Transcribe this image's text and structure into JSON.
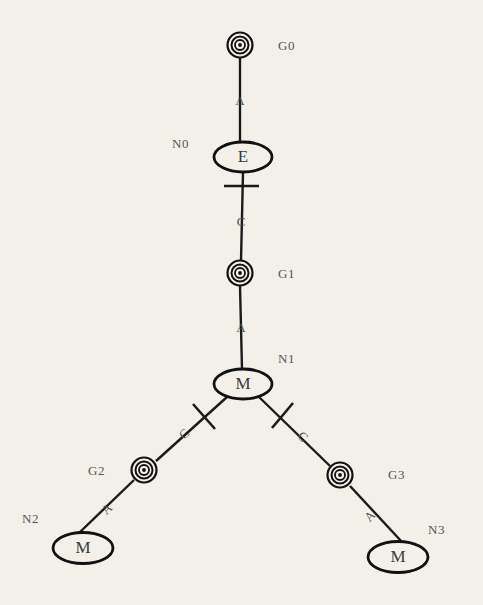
{
  "diagram": {
    "background_color": "#f3f0ea",
    "stroke_color": "#111111",
    "label_color": "#55544f",
    "nodes": [
      {
        "id": "G0",
        "kind": "bullseye",
        "label": "G0",
        "cx": 240,
        "cy": 45,
        "label_x": 278,
        "label_y": 49
      },
      {
        "id": "N0",
        "kind": "ellipse",
        "text": "E",
        "label": "N0",
        "cx": 243,
        "cy": 157,
        "rx": 29,
        "ry": 15,
        "label_x": 172,
        "label_y": 147
      },
      {
        "id": "G1",
        "kind": "bullseye",
        "label": "G1",
        "cx": 240,
        "cy": 273,
        "label_x": 278,
        "label_y": 277
      },
      {
        "id": "N1",
        "kind": "ellipse",
        "text": "M",
        "label": "N1",
        "cx": 243,
        "cy": 384,
        "rx": 29,
        "ry": 15,
        "label_x": 278,
        "label_y": 360
      },
      {
        "id": "G2",
        "kind": "bullseye",
        "label": "G2",
        "cx": 144,
        "cy": 470,
        "label_x": 88,
        "label_y": 472
      },
      {
        "id": "G3",
        "kind": "bullseye",
        "label": "G3",
        "cx": 340,
        "cy": 475,
        "label_x": 388,
        "label_y": 474
      },
      {
        "id": "N2",
        "kind": "ellipse",
        "text": "M",
        "label": "N2",
        "cx": 83,
        "cy": 548,
        "rx": 29,
        "ry": 15,
        "label_x": 22,
        "label_y": 518
      },
      {
        "id": "N3",
        "kind": "ellipse",
        "text": "M",
        "label": "N3",
        "cx": 398,
        "cy": 557,
        "rx": 29,
        "ry": 15,
        "label_x": 428,
        "label_y": 530
      }
    ],
    "edges": [
      {
        "from": "G0",
        "to": "N0",
        "label": "A",
        "x1": 240,
        "y1": 58,
        "x2": 240,
        "y2": 142,
        "label_x": 240,
        "label_y": 101,
        "crossbar": false
      },
      {
        "from": "N0",
        "to": "G1",
        "label": "C",
        "x1": 243,
        "y1": 172,
        "x2": 241,
        "y2": 261,
        "label_x": 241,
        "label_y": 222,
        "crossbar": true,
        "bar_x1": 224,
        "bar_y1": 186,
        "bar_x2": 259,
        "bar_y2": 186
      },
      {
        "from": "G1",
        "to": "N1",
        "label": "A",
        "x1": 240,
        "y1": 286,
        "x2": 242,
        "y2": 369,
        "label_x": 241,
        "label_y": 328,
        "crossbar": false
      },
      {
        "from": "N1",
        "to": "G2",
        "label": "C",
        "x1": 226,
        "y1": 398,
        "x2": 155,
        "y2": 461,
        "label_x": 186,
        "label_y": 434,
        "crossbar": true,
        "bar_x1": 194,
        "bar_y1": 404,
        "bar_x2": 215,
        "bar_y2": 428
      },
      {
        "from": "N1",
        "to": "G3",
        "label": "C",
        "x1": 260,
        "y1": 398,
        "x2": 330,
        "y2": 466,
        "label_x": 299,
        "label_y": 437,
        "crossbar": true,
        "bar_x1": 272,
        "bar_y1": 427,
        "bar_x2": 292,
        "bar_y2": 403
      },
      {
        "from": "G2",
        "to": "N2",
        "label": "A",
        "x1": 133,
        "y1": 480,
        "x2": 78,
        "y2": 533,
        "label_x": 108,
        "label_y": 508,
        "crossbar": false
      },
      {
        "from": "G3",
        "to": "N3",
        "label": "A",
        "x1": 350,
        "y1": 485,
        "x2": 401,
        "y2": 542,
        "label_x": 372,
        "label_y": 516,
        "crossbar": false
      }
    ]
  }
}
